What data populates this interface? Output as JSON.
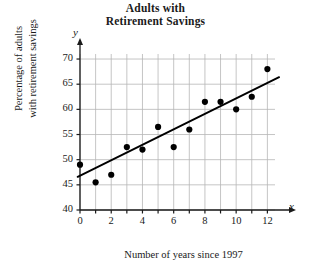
{
  "chart_data": {
    "type": "scatter",
    "title": "Adults with Retirement Savings",
    "title_line1": "Adults with",
    "title_line2": "Retirement Savings",
    "xlabel": "Number of years since 1997",
    "ylabel": "Percentage of adults with retirement savings",
    "ylabel_line1": "Percentage of adults",
    "ylabel_line2": "with retirement savings",
    "x_axis_letter": "x",
    "y_axis_letter": "y",
    "xlim": [
      0,
      13
    ],
    "ylim": [
      40,
      71
    ],
    "xticks": [
      0,
      2,
      4,
      6,
      8,
      10,
      12
    ],
    "yticks": [
      40,
      45,
      50,
      55,
      60,
      65,
      70
    ],
    "grid": true,
    "grid_x_step": 1,
    "grid_y_step": 5,
    "legend": "none",
    "x": [
      0,
      1,
      2,
      3,
      4,
      5,
      6,
      7,
      8,
      9,
      10,
      11,
      12
    ],
    "values": [
      49,
      45.5,
      47,
      52.5,
      52,
      56.5,
      52.5,
      56,
      61.5,
      61.5,
      60,
      62.5,
      68
    ],
    "points": [
      {
        "x": 0,
        "y": 49
      },
      {
        "x": 1,
        "y": 45.5
      },
      {
        "x": 2,
        "y": 47
      },
      {
        "x": 3,
        "y": 52.5
      },
      {
        "x": 4,
        "y": 52
      },
      {
        "x": 5,
        "y": 56.5
      },
      {
        "x": 6,
        "y": 52.5
      },
      {
        "x": 7,
        "y": 56
      },
      {
        "x": 8,
        "y": 61.5
      },
      {
        "x": 9,
        "y": 61.5
      },
      {
        "x": 10,
        "y": 60
      },
      {
        "x": 11,
        "y": 62.5
      },
      {
        "x": 12,
        "y": 68
      }
    ],
    "trend_line": {
      "type": "line-of-best-fit",
      "x_start": -0.15,
      "y_start": 46.6,
      "x_end": 12.75,
      "y_end": 66.4
    },
    "marker_color": "#000000",
    "line_color": "#000000",
    "grid_color": "#b6b6b6",
    "axis_color": "#1a1a1a"
  }
}
